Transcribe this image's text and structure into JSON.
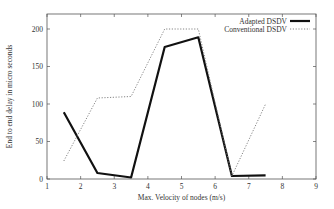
{
  "chart_data": {
    "type": "line",
    "title": "",
    "xlabel": "Max. Velocity of nodes (m/s)",
    "ylabel": "End to end delay in micro seconds",
    "xlim": [
      1,
      9
    ],
    "ylim": [
      0,
      220
    ],
    "xticks": [
      1,
      2,
      3,
      4,
      5,
      6,
      7,
      8,
      9
    ],
    "yticks": [
      0,
      50,
      100,
      150,
      200
    ],
    "grid": false,
    "legend_position": "top-right",
    "series": [
      {
        "name": "Adapted DSDV",
        "style": "solid",
        "color": "#111111",
        "x": [
          1.5,
          2.5,
          3.5,
          4.5,
          5.5,
          6.5,
          7.5
        ],
        "y": [
          89,
          8,
          2,
          176,
          189,
          4,
          5
        ]
      },
      {
        "name": "Conventional DSDV",
        "style": "dotted",
        "color": "#777777",
        "x": [
          1.5,
          2.5,
          3.5,
          4.5,
          5.5,
          6.5,
          7.5
        ],
        "y": [
          24,
          108,
          110,
          200,
          200,
          4,
          100
        ]
      }
    ]
  },
  "plot": {
    "left": 47,
    "right": 316,
    "top": 14,
    "bottom": 179
  }
}
